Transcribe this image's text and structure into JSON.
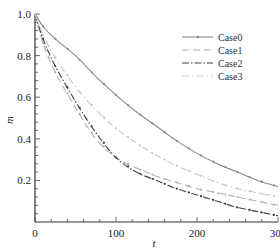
{
  "chart_data": {
    "type": "line",
    "title": "",
    "xlabel": "t",
    "ylabel": "m",
    "xlim": [
      0,
      300
    ],
    "ylim": [
      0,
      1.0
    ],
    "x_ticks": [
      0,
      100,
      200,
      300
    ],
    "x_tick_labels": [
      "0",
      "100",
      "200",
      "300"
    ],
    "y_ticks": [
      0.2,
      0.4,
      0.6,
      0.8,
      1.0
    ],
    "y_tick_labels": [
      "0.2",
      "0.4",
      "0.6",
      "0.8",
      "1.0"
    ],
    "grid": false,
    "legend_position": "upper right",
    "x": [
      0,
      10,
      25,
      50,
      75,
      100,
      125,
      150,
      175,
      200,
      225,
      250,
      275,
      300
    ],
    "series": [
      {
        "name": "Case0",
        "style": "solid-marker",
        "color": "#8a8a8a",
        "values": [
          1.0,
          0.94,
          0.88,
          0.8,
          0.7,
          0.61,
          0.53,
          0.46,
          0.39,
          0.33,
          0.28,
          0.24,
          0.2,
          0.17
        ]
      },
      {
        "name": "Case1",
        "style": "dashed",
        "color": "#b0b0b0",
        "values": [
          1.0,
          0.86,
          0.72,
          0.55,
          0.4,
          0.31,
          0.26,
          0.22,
          0.19,
          0.16,
          0.14,
          0.12,
          0.1,
          0.08
        ]
      },
      {
        "name": "Case2",
        "style": "dash-dot",
        "color": "#444444",
        "values": [
          1.0,
          0.88,
          0.75,
          0.58,
          0.43,
          0.31,
          0.24,
          0.2,
          0.16,
          0.13,
          0.1,
          0.07,
          0.05,
          0.03
        ]
      },
      {
        "name": "Case3",
        "style": "dash-dot-light",
        "color": "#c8c8c8",
        "values": [
          1.0,
          0.9,
          0.79,
          0.65,
          0.54,
          0.45,
          0.38,
          0.32,
          0.27,
          0.23,
          0.19,
          0.16,
          0.14,
          0.12
        ]
      }
    ]
  }
}
